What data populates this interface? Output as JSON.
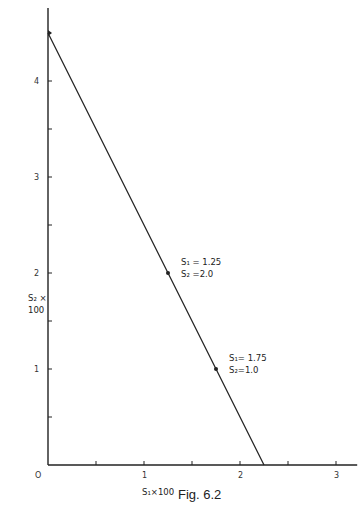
{
  "chart_data": {
    "type": "line",
    "title": "",
    "caption": "Fig. 6.2",
    "xlabel": "S₁×100",
    "ylabel_line1": "S₂ ×",
    "ylabel_line2": "100",
    "xlim": [
      0,
      3.2
    ],
    "ylim": [
      0,
      4.8
    ],
    "grid": false,
    "origin_label": "O",
    "x_ticks": [
      {
        "value": 0.5,
        "label": ""
      },
      {
        "value": 1,
        "label": "1"
      },
      {
        "value": 1.5,
        "label": ""
      },
      {
        "value": 2,
        "label": "2"
      },
      {
        "value": 2.5,
        "label": ""
      },
      {
        "value": 3,
        "label": "3"
      }
    ],
    "y_ticks": [
      {
        "value": 0.5,
        "label": ""
      },
      {
        "value": 1,
        "label": "1"
      },
      {
        "value": 1.5,
        "label": ""
      },
      {
        "value": 2,
        "label": "2"
      },
      {
        "value": 2.5,
        "label": ""
      },
      {
        "value": 3,
        "label": "3"
      },
      {
        "value": 3.5,
        "label": ""
      },
      {
        "value": 4,
        "label": "4"
      }
    ],
    "series": [
      {
        "name": "constraint line",
        "x": [
          0,
          2.25
        ],
        "y": [
          4.5,
          0
        ]
      }
    ],
    "points": [
      {
        "x": 1.25,
        "y": 2.0,
        "label1": "S₁ = 1.25",
        "label2": "S₂ =2.0"
      },
      {
        "x": 1.75,
        "y": 1.0,
        "label1": "S₁= 1.75",
        "label2": "S₂=1.0"
      }
    ]
  }
}
